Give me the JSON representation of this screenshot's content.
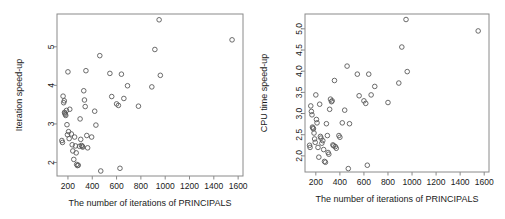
{
  "figure": {
    "background": "#ffffff",
    "marker_color": "#5a5a5a",
    "axis_color": "#8a8a8a"
  },
  "panels": [
    {
      "id": "iteration-speedup",
      "ylabel": "Iteration speed-up",
      "xlabel": "The number of iterations of PRINCIPALS",
      "xticks": [
        200,
        400,
        600,
        800,
        1000,
        1200,
        1400,
        1600
      ],
      "yticks": [
        2,
        3,
        4,
        5
      ],
      "xtick_labels": [
        "200",
        "400",
        "600",
        "800",
        "1000",
        "1200",
        "1400",
        "1600"
      ],
      "ytick_labels": [
        "2",
        "3",
        "4",
        "5"
      ]
    },
    {
      "id": "cpu-time-speedup",
      "ylabel": "CPU time speed-up",
      "xlabel": "The number of iterations of PRINCIPALS",
      "xticks": [
        200,
        400,
        600,
        800,
        1000,
        1200,
        1400,
        1600
      ],
      "yticks": [
        2.0,
        2.5,
        3.0,
        3.5,
        4.0,
        4.5,
        5.0
      ],
      "xtick_labels": [
        "200",
        "400",
        "600",
        "800",
        "1000",
        "1200",
        "1400",
        "1600"
      ],
      "ytick_labels": [
        "2.0",
        "2.5",
        "3.0",
        "3.5",
        "4.0",
        "4.5",
        "5.0"
      ]
    }
  ],
  "chart_data": [
    {
      "type": "scatter",
      "title": "",
      "xlabel": "The number of iterations of PRINCIPALS",
      "ylabel": "Iteration speed-up",
      "xlim": [
        110,
        1640
      ],
      "ylim": [
        1.65,
        5.85
      ],
      "grid": false,
      "legend": "none",
      "marker": "open-circle",
      "xticks": [
        200,
        400,
        600,
        800,
        1000,
        1200,
        1400,
        1600
      ],
      "yticks": [
        2,
        3,
        4,
        5
      ],
      "points": [
        [
          150,
          2.57
        ],
        [
          155,
          2.52
        ],
        [
          160,
          3.72
        ],
        [
          165,
          3.55
        ],
        [
          170,
          3.6
        ],
        [
          172,
          3.3
        ],
        [
          175,
          3.28
        ],
        [
          178,
          3.25
        ],
        [
          182,
          3.22
        ],
        [
          188,
          3.35
        ],
        [
          192,
          2.98
        ],
        [
          196,
          2.72
        ],
        [
          200,
          4.35
        ],
        [
          205,
          2.8
        ],
        [
          210,
          2.62
        ],
        [
          215,
          3.38
        ],
        [
          228,
          2.74
        ],
        [
          235,
          2.46
        ],
        [
          240,
          2.3
        ],
        [
          248,
          2.08
        ],
        [
          255,
          2.66
        ],
        [
          262,
          2.43
        ],
        [
          268,
          2.25
        ],
        [
          272,
          1.95
        ],
        [
          278,
          1.92
        ],
        [
          285,
          1.93
        ],
        [
          295,
          2.42
        ],
        [
          300,
          3.13
        ],
        [
          305,
          2.6
        ],
        [
          312,
          2.44
        ],
        [
          318,
          2.42
        ],
        [
          322,
          2.4
        ],
        [
          330,
          3.86
        ],
        [
          336,
          3.62
        ],
        [
          342,
          3.45
        ],
        [
          348,
          4.38
        ],
        [
          355,
          2.7
        ],
        [
          362,
          2.38
        ],
        [
          395,
          2.66
        ],
        [
          420,
          3.33
        ],
        [
          430,
          2.97
        ],
        [
          462,
          4.77
        ],
        [
          470,
          1.78
        ],
        [
          545,
          4.31
        ],
        [
          560,
          3.71
        ],
        [
          600,
          3.52
        ],
        [
          615,
          3.48
        ],
        [
          628,
          1.85
        ],
        [
          640,
          4.29
        ],
        [
          660,
          3.66
        ],
        [
          690,
          3.99
        ],
        [
          780,
          3.46
        ],
        [
          890,
          3.96
        ],
        [
          915,
          4.93
        ],
        [
          950,
          5.7
        ],
        [
          960,
          4.26
        ],
        [
          1550,
          5.18
        ]
      ]
    },
    {
      "type": "scatter",
      "title": "",
      "xlabel": "The number of iterations of PRINCIPALS",
      "ylabel": "CPU time speed-up",
      "xlim": [
        110,
        1640
      ],
      "ylim": [
        1.62,
        5.35
      ],
      "grid": false,
      "legend": "none",
      "marker": "open-circle",
      "xticks": [
        200,
        400,
        600,
        800,
        1000,
        1200,
        1400,
        1600
      ],
      "yticks": [
        2.0,
        2.5,
        3.0,
        3.5,
        4.0,
        4.5,
        5.0
      ],
      "points": [
        [
          148,
          2.25
        ],
        [
          152,
          2.2
        ],
        [
          158,
          3.18
        ],
        [
          163,
          3.05
        ],
        [
          168,
          2.97
        ],
        [
          172,
          2.68
        ],
        [
          176,
          2.66
        ],
        [
          180,
          2.64
        ],
        [
          185,
          2.54
        ],
        [
          190,
          2.4
        ],
        [
          195,
          2.32
        ],
        [
          200,
          3.44
        ],
        [
          205,
          2.86
        ],
        [
          210,
          2.78
        ],
        [
          218,
          2.2
        ],
        [
          225,
          1.97
        ],
        [
          232,
          3.22
        ],
        [
          238,
          2.46
        ],
        [
          243,
          2.42
        ],
        [
          250,
          2.3
        ],
        [
          258,
          2.36
        ],
        [
          265,
          2.15
        ],
        [
          272,
          1.87
        ],
        [
          280,
          1.85
        ],
        [
          288,
          2.76
        ],
        [
          296,
          2.48
        ],
        [
          302,
          2.08
        ],
        [
          308,
          2.04
        ],
        [
          315,
          3.1
        ],
        [
          322,
          3.34
        ],
        [
          330,
          3.28
        ],
        [
          336,
          3.3
        ],
        [
          342,
          2.26
        ],
        [
          348,
          2.24
        ],
        [
          355,
          3.78
        ],
        [
          362,
          2.22
        ],
        [
          370,
          2.18
        ],
        [
          392,
          2.48
        ],
        [
          400,
          2.44
        ],
        [
          420,
          2.78
        ],
        [
          440,
          3.08
        ],
        [
          460,
          4.12
        ],
        [
          470,
          1.7
        ],
        [
          480,
          2.76
        ],
        [
          545,
          3.93
        ],
        [
          560,
          3.42
        ],
        [
          600,
          3.3
        ],
        [
          615,
          3.24
        ],
        [
          628,
          1.78
        ],
        [
          640,
          3.93
        ],
        [
          660,
          3.44
        ],
        [
          690,
          3.64
        ],
        [
          800,
          3.26
        ],
        [
          890,
          3.72
        ],
        [
          915,
          4.57
        ],
        [
          950,
          5.22
        ],
        [
          960,
          3.99
        ],
        [
          1550,
          4.95
        ]
      ]
    }
  ]
}
